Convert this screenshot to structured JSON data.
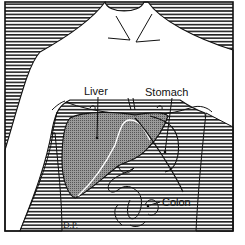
{
  "figure": {
    "labels": {
      "liver": "Liver",
      "stomach": "Stomach",
      "colon": "Colon"
    },
    "signature": "D.P.",
    "colors": {
      "line": "#111111",
      "hatch": "#222222",
      "liver_fill": "#8a8a8a",
      "background": "#ffffff"
    }
  }
}
